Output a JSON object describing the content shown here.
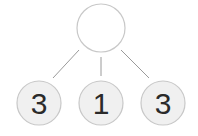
{
  "diagram": {
    "type": "number-bond",
    "top": {
      "value": ""
    },
    "parts": [
      {
        "value": "3"
      },
      {
        "value": "1"
      },
      {
        "value": "3"
      }
    ],
    "colors": {
      "stroke": "#c8c8c8",
      "line": "#9a9a9a",
      "part_fill": "#f0f0f0",
      "top_fill": "#ffffff",
      "text": "#2a2a2a"
    }
  }
}
